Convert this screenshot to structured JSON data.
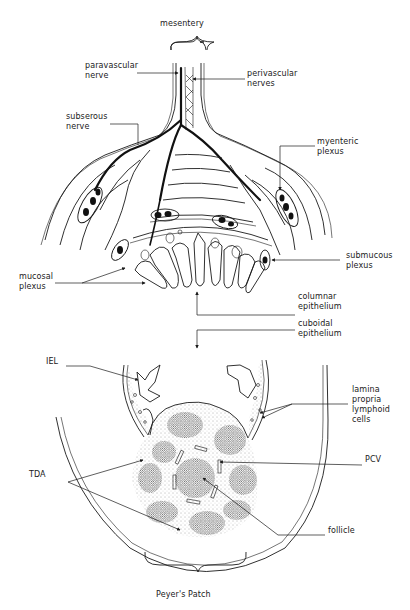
{
  "figure": {
    "top_title": "mesentery",
    "bottom_title": "Peyer's  Patch",
    "labels": [
      {
        "id": "paravascular-nerve",
        "text": "paravascular\nnerve",
        "x": 85,
        "y": 61
      },
      {
        "id": "perivascular-nerves",
        "text": "perivascular\nnerves",
        "x": 247,
        "y": 69
      },
      {
        "id": "subserous-nerve",
        "text": "subserous\nnerve",
        "x": 66,
        "y": 112
      },
      {
        "id": "myenteric-plexus",
        "text": "myenteric\nplexus",
        "x": 317,
        "y": 137
      },
      {
        "id": "submucous-plexus",
        "text": "submucous\nplexus",
        "x": 346,
        "y": 251
      },
      {
        "id": "mucosal-plexus",
        "text": "mucosal\nplexus",
        "x": 19,
        "y": 272
      },
      {
        "id": "columnar-epithelium",
        "text": "columnar\nepithelium",
        "x": 298,
        "y": 292
      },
      {
        "id": "cuboidal-epithelium",
        "text": "cuboidal\nepithelium",
        "x": 298,
        "y": 319
      },
      {
        "id": "iel",
        "text": "IEL",
        "x": 46,
        "y": 357
      },
      {
        "id": "lamina-propria",
        "text": "lamina\npropria\nlymphoid\ncells",
        "x": 352,
        "y": 385
      },
      {
        "id": "pcv",
        "text": "PCV",
        "x": 365,
        "y": 455
      },
      {
        "id": "tda",
        "text": "TDA",
        "x": 29,
        "y": 470
      },
      {
        "id": "follicle",
        "text": "follicle",
        "x": 328,
        "y": 526
      }
    ]
  }
}
